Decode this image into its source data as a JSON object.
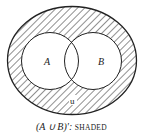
{
  "diagram": {
    "type": "venn",
    "sets": [
      {
        "name": "A",
        "label": "A"
      },
      {
        "name": "B",
        "label": "B"
      }
    ],
    "universe_label": "u",
    "shaded_region": "complement of A union B",
    "colors": {
      "stroke": "#222222",
      "hatch": "#333333",
      "background": "#ffffff"
    }
  },
  "caption": {
    "expression": "(A ∪ B)′:",
    "word": "SHADED"
  }
}
